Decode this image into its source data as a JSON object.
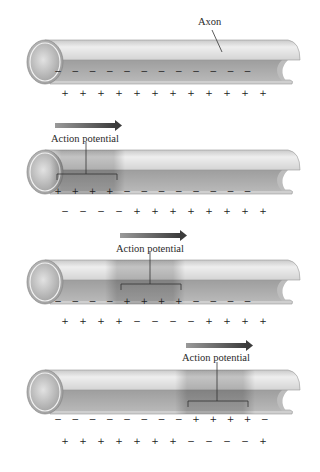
{
  "figure": {
    "colors": {
      "axon_outer": "#d9d9d9",
      "axon_inner": "#a8a8a8",
      "action_potential_region": "#9a9a9a",
      "arrow": "#555555",
      "text": "#2a2a2a"
    }
  },
  "panels": [
    {
      "id": 1,
      "label": "Axon",
      "has_arrow": false,
      "inside_charges": [
        "−",
        "−",
        "−",
        "−",
        "−",
        "−",
        "−",
        "−",
        "−",
        "−",
        "−",
        "−"
      ],
      "outside_charges": [
        "+",
        "+",
        "+",
        "+",
        "+",
        "+",
        "+",
        "+",
        "+",
        "+",
        "+",
        "+"
      ]
    },
    {
      "id": 2,
      "label": "Action potential",
      "has_arrow": true,
      "inside_charges": [
        "+",
        "+",
        "+",
        "+",
        "−",
        "−",
        "−",
        "−",
        "−",
        "−",
        "−",
        "−"
      ],
      "outside_charges": [
        "−",
        "−",
        "−",
        "−",
        "+",
        "+",
        "+",
        "+",
        "+",
        "+",
        "+",
        "+"
      ]
    },
    {
      "id": 3,
      "label": "Action potential",
      "has_arrow": true,
      "inside_charges": [
        "−",
        "−",
        "−",
        "−",
        "+",
        "+",
        "+",
        "+",
        "−",
        "−",
        "−",
        "−"
      ],
      "outside_charges": [
        "+",
        "+",
        "+",
        "+",
        "−",
        "−",
        "−",
        "−",
        "+",
        "+",
        "+",
        "+"
      ]
    },
    {
      "id": 4,
      "label": "Action potential",
      "has_arrow": true,
      "inside_charges": [
        "−",
        "−",
        "−",
        "−",
        "−",
        "−",
        "−",
        "−",
        "+",
        "+",
        "+",
        "+",
        "−"
      ],
      "outside_charges": [
        "+",
        "+",
        "+",
        "+",
        "+",
        "+",
        "+",
        "−",
        "−",
        "−",
        "−",
        "+"
      ]
    }
  ]
}
